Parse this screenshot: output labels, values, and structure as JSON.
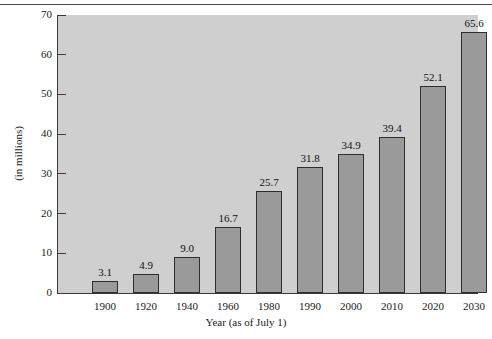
{
  "chart_data": {
    "type": "bar",
    "title": "",
    "xlabel": "Year (as of July 1)",
    "ylabel": "(in millions)",
    "categories": [
      "1900",
      "1920",
      "1940",
      "1960",
      "1980",
      "1990",
      "2000",
      "2010",
      "2020",
      "2030"
    ],
    "values": [
      3.1,
      4.9,
      9.0,
      16.7,
      25.7,
      31.8,
      34.9,
      39.4,
      52.1,
      65.6
    ],
    "value_labels": [
      "3.1",
      "4.9",
      "9.0",
      "16.7",
      "25.7",
      "31.8",
      "34.9",
      "39.4",
      "52.1",
      "65.6"
    ],
    "ylim": [
      0,
      70
    ],
    "ytick_labels": [
      "0",
      "10",
      "20",
      "30",
      "40",
      "50",
      "60",
      "70"
    ],
    "ytick_values": [
      0,
      10,
      20,
      30,
      40,
      50,
      60,
      70
    ],
    "grid": false,
    "legend": "none",
    "colors": {
      "bar_fill": "#9a9a9a",
      "bar_border": "#2e2e2e",
      "plot_background": "#cfcfcf",
      "figure_background": "#ffffff",
      "axis": "#3a3a3a",
      "text": "#1a1a1a"
    }
  }
}
